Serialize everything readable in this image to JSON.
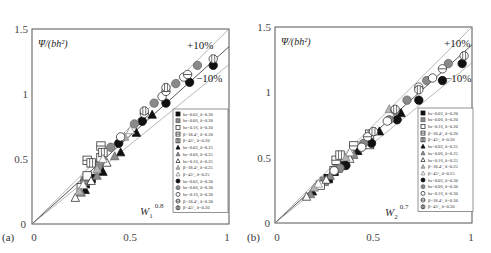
{
  "chart_data": [
    {
      "panel": "(a)",
      "type": "scatter",
      "ylabel": "Ψ/(bh²)",
      "xlabel": "W1^0.8",
      "xlabel_base": "W",
      "xlabel_sub": "1",
      "xlabel_sup": "0.8",
      "xlim": [
        0,
        1
      ],
      "ylim": [
        0,
        1.5
      ],
      "xticks": [
        "0",
        "0.5",
        "1"
      ],
      "yticks": [
        "0",
        "0.5",
        "1",
        "1.5"
      ],
      "reference_lines": [
        {
          "label": "+10%",
          "slope": 1.5
        },
        {
          "label": "",
          "slope": 1.364
        },
        {
          "label": "-10%",
          "slope": 1.227
        }
      ],
      "band_labels": {
        "upper": "+10%",
        "lower": "−10%"
      },
      "legend": [
        "hs=0.02, δ=0.20",
        "hs=0.06, δ=0.20",
        "hs=0.16, δ=0.20",
        "β=18.4°, δ=0.20",
        "β=45°, δ=0.20",
        "hs=0.02, δ=0.25",
        "hs=0.06, δ=0.25",
        "hs=0.16, δ=0.25",
        "β=18.4°, δ=0.25",
        "β=45°, δ=0.25",
        "hs=0.02, δ=0.30",
        "hs=0.06, δ=0.30",
        "hs=0.16, δ=0.30",
        "β=18.4°, δ=0.30",
        "β=45°, δ=0.30"
      ],
      "series": [
        {
          "name": "hs=0.02, δ=0.20",
          "marker": "square-filled",
          "points": [
            [
              0.27,
              0.31
            ],
            [
              0.3,
              0.35
            ]
          ]
        },
        {
          "name": "hs=0.06, δ=0.20",
          "marker": "square-gray",
          "points": [
            [
              0.27,
              0.33
            ],
            [
              0.34,
              0.45
            ]
          ]
        },
        {
          "name": "hs=0.16, δ=0.20",
          "marker": "square-open",
          "points": [
            [
              0.25,
              0.28
            ],
            [
              0.28,
              0.37
            ],
            [
              0.35,
              0.51
            ]
          ]
        },
        {
          "name": "β=18.4°, δ=0.20",
          "marker": "square-line",
          "points": [
            [
              0.28,
              0.49
            ],
            [
              0.35,
              0.6
            ]
          ]
        },
        {
          "name": "β=45°, δ=0.20",
          "marker": "square-vline",
          "points": [
            [
              0.3,
              0.47
            ],
            [
              0.36,
              0.55
            ]
          ]
        },
        {
          "name": "hs=0.02, δ=0.25",
          "marker": "triangle-filled",
          "points": [
            [
              0.27,
              0.26
            ],
            [
              0.36,
              0.4
            ],
            [
              0.45,
              0.55
            ],
            [
              0.53,
              0.7
            ],
            [
              0.61,
              0.84
            ]
          ]
        },
        {
          "name": "hs=0.06, δ=0.25",
          "marker": "triangle-gray",
          "points": [
            [
              0.25,
              0.24
            ],
            [
              0.33,
              0.37
            ],
            [
              0.42,
              0.52
            ]
          ]
        },
        {
          "name": "hs=0.16, δ=0.25",
          "marker": "triangle-open",
          "points": [
            [
              0.22,
              0.2
            ],
            [
              0.3,
              0.33
            ],
            [
              0.38,
              0.47
            ]
          ]
        },
        {
          "name": "β=18.4°, δ=0.25",
          "marker": "triangle-light",
          "points": [
            [
              0.24,
              0.25
            ],
            [
              0.33,
              0.42
            ],
            [
              0.47,
              0.67
            ]
          ]
        },
        {
          "name": "β=45°, δ=0.25",
          "marker": "triangle-outline",
          "points": [
            [
              0.26,
              0.3
            ],
            [
              0.36,
              0.5
            ],
            [
              0.5,
              0.72
            ]
          ]
        },
        {
          "name": "hs=0.02, δ=0.30",
          "marker": "circle-filled",
          "points": [
            [
              0.44,
              0.62
            ],
            [
              0.56,
              0.79
            ],
            [
              0.68,
              0.93
            ],
            [
              0.8,
              1.09
            ],
            [
              0.92,
              1.22
            ]
          ]
        },
        {
          "name": "hs=0.06, δ=0.30",
          "marker": "circle-gray",
          "points": [
            [
              0.4,
              0.59
            ],
            [
              0.52,
              0.77
            ],
            [
              0.62,
              0.93
            ],
            [
              0.73,
              1.08
            ],
            [
              0.84,
              1.22
            ]
          ]
        },
        {
          "name": "hs=0.16, δ=0.30",
          "marker": "circle-open",
          "points": [
            [
              0.45,
              0.67
            ],
            [
              0.66,
              0.98
            ],
            [
              0.77,
              1.13
            ]
          ]
        },
        {
          "name": "β=18.4°, δ=0.30",
          "marker": "circle-line",
          "points": [
            [
              0.57,
              0.85
            ],
            [
              0.68,
              1.02
            ],
            [
              0.79,
              1.15
            ]
          ]
        },
        {
          "name": "β=45°, δ=0.30",
          "marker": "circle-vline",
          "points": [
            [
              0.57,
              0.87
            ],
            [
              0.68,
              1.05
            ],
            [
              0.92,
              1.27
            ]
          ]
        }
      ]
    },
    {
      "panel": "(b)",
      "type": "scatter",
      "ylabel": "Ψ/(bh²)",
      "xlabel": "W2^0.7",
      "xlabel_base": "W",
      "xlabel_sub": "2",
      "xlabel_sup": "0.7",
      "xlim": [
        0,
        1
      ],
      "ylim": [
        0,
        1.5
      ],
      "xticks": [
        "0",
        "0.5",
        "1"
      ],
      "yticks": [
        "0",
        "0.5",
        "1",
        "1.5"
      ],
      "reference_lines": [
        {
          "label": "+10%",
          "slope": 1.5
        },
        {
          "label": "",
          "slope": 1.364
        },
        {
          "label": "-10%",
          "slope": 1.227
        }
      ],
      "band_labels": {
        "upper": "+10%",
        "lower": "−10%"
      },
      "legend": [
        "hs=0.02, δ=0.20",
        "hs=0.06, δ=0.20",
        "hs=0.16, δ=0.20",
        "β=18.4°, δ=0.20",
        "β=45°, δ=0.20",
        "hs=0.02, δ=0.25",
        "hs=0.06, δ=0.25",
        "hs=0.16, δ=0.25",
        "β=18.4°, δ=0.25",
        "β=45°, δ=0.25",
        "hs=0.02, δ=0.30",
        "hs=0.06, δ=0.30",
        "hs=0.16, δ=0.30",
        "β=18.4°, δ=0.30",
        "β=45°, δ=0.30"
      ],
      "series": [
        {
          "name": "hs=0.02, δ=0.20",
          "marker": "square-filled",
          "points": [
            [
              0.27,
              0.34
            ],
            [
              0.33,
              0.44
            ]
          ]
        },
        {
          "name": "hs=0.06, δ=0.20",
          "marker": "square-gray",
          "points": [
            [
              0.25,
              0.32
            ],
            [
              0.32,
              0.42
            ]
          ]
        },
        {
          "name": "hs=0.16, δ=0.20",
          "marker": "square-open",
          "points": [
            [
              0.23,
              0.29
            ],
            [
              0.3,
              0.4
            ],
            [
              0.48,
              0.6
            ]
          ]
        },
        {
          "name": "β=18.4°, δ=0.20",
          "marker": "square-line",
          "points": [
            [
              0.31,
              0.48
            ],
            [
              0.4,
              0.59
            ]
          ]
        },
        {
          "name": "β=45°, δ=0.20",
          "marker": "square-vline",
          "points": [
            [
              0.33,
              0.52
            ],
            [
              0.48,
              0.68
            ]
          ]
        },
        {
          "name": "hs=0.02, δ=0.25",
          "marker": "triangle-filled",
          "points": [
            [
              0.19,
              0.24
            ],
            [
              0.3,
              0.39
            ],
            [
              0.42,
              0.55
            ],
            [
              0.53,
              0.7
            ],
            [
              0.64,
              0.84
            ]
          ]
        },
        {
          "name": "hs=0.06, δ=0.25",
          "marker": "triangle-gray",
          "points": [
            [
              0.18,
              0.22
            ],
            [
              0.28,
              0.36
            ],
            [
              0.4,
              0.52
            ]
          ]
        },
        {
          "name": "hs=0.16, δ=0.25",
          "marker": "triangle-open",
          "points": [
            [
              0.16,
              0.2
            ],
            [
              0.26,
              0.33
            ],
            [
              0.38,
              0.49
            ]
          ]
        },
        {
          "name": "β=18.4°, δ=0.25",
          "marker": "triangle-light",
          "points": [
            [
              0.2,
              0.27
            ],
            [
              0.36,
              0.5
            ],
            [
              0.58,
              0.87
            ]
          ]
        },
        {
          "name": "β=45°, δ=0.25",
          "marker": "triangle-outline",
          "points": [
            [
              0.22,
              0.3
            ],
            [
              0.38,
              0.54
            ],
            [
              0.5,
              0.7
            ]
          ]
        },
        {
          "name": "hs=0.02, δ=0.30",
          "marker": "circle-filled",
          "points": [
            [
              0.36,
              0.44
            ],
            [
              0.49,
              0.61
            ],
            [
              0.62,
              0.79
            ],
            [
              0.73,
              0.94
            ],
            [
              0.85,
              1.09
            ],
            [
              0.95,
              1.22
            ]
          ]
        },
        {
          "name": "hs=0.06, δ=0.30",
          "marker": "circle-gray",
          "points": [
            [
              0.33,
              0.42
            ],
            [
              0.45,
              0.61
            ],
            [
              0.58,
              0.79
            ],
            [
              0.67,
              0.94
            ],
            [
              0.77,
              1.09
            ],
            [
              0.88,
              1.22
            ]
          ]
        },
        {
          "name": "hs=0.16, δ=0.30",
          "marker": "circle-open",
          "points": [
            [
              0.3,
              0.4
            ],
            [
              0.44,
              0.58
            ],
            [
              0.57,
              0.78
            ],
            [
              0.8,
              1.11
            ]
          ]
        },
        {
          "name": "β=18.4°, δ=0.30",
          "marker": "circle-line",
          "points": [
            [
              0.47,
              0.66
            ],
            [
              0.61,
              0.86
            ],
            [
              0.73,
              1.04
            ],
            [
              0.85,
              1.18
            ]
          ]
        },
        {
          "name": "β=45°, δ=0.30",
          "marker": "circle-vline",
          "points": [
            [
              0.5,
              0.7
            ],
            [
              0.61,
              0.87
            ],
            [
              0.73,
              1.02
            ],
            [
              0.96,
              1.28
            ]
          ]
        }
      ]
    }
  ]
}
